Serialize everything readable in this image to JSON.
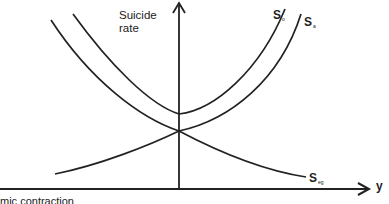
{
  "diagram": {
    "y_axis_label_line1": "Suicide",
    "y_axis_label_line2": "rate",
    "x_axis_label": "y",
    "caption_partial": "mic contraction",
    "curves": [
      {
        "id": "overall",
        "label": "S",
        "subscript": "o",
        "shape": "U-shaped, upper"
      },
      {
        "id": "anomic",
        "label": "S",
        "subscript": "a",
        "shape": "U-shaped, lower (inner)"
      },
      {
        "id": "egoistic",
        "label": "S",
        "subscript": "eg",
        "shape": "decreasing rightward from crossing at y-axis"
      }
    ],
    "line_color": "#222222",
    "background": "#ffffff"
  }
}
